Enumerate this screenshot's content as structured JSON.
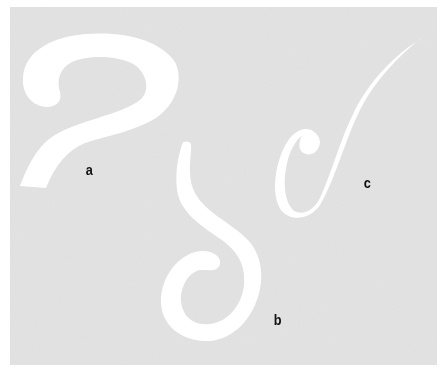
{
  "figure": {
    "background_color": "#e3e3e3",
    "shape_color": "#ffffff",
    "label_color": "#111111",
    "shapes": [
      {
        "id": "a",
        "label": "a",
        "description": "thick question-mark shaped curve"
      },
      {
        "id": "b",
        "label": "b",
        "description": "S-shaped curve with inward hook at bottom"
      },
      {
        "id": "c",
        "label": "c",
        "description": "thin tapering curve with loop and rounded knob"
      }
    ]
  }
}
